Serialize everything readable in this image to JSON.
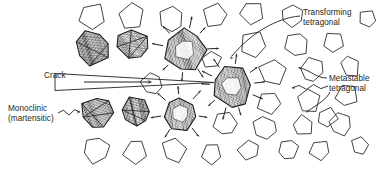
{
  "figure": {
    "domain": "materials-science-schematic",
    "width": 387,
    "height": 171,
    "background_color": "#ffffff",
    "ink_color": "#231f20",
    "text_color": "#231f20"
  },
  "labels": {
    "transforming": "Transforming\ntetragonal",
    "metastable": "Metastable\ntetragonal",
    "monoclinic": "Monoclinic\n(martensitic)",
    "crack": "Crack"
  },
  "legend_items": [
    {
      "id": "monoclinic",
      "text": "Monoclinic\n(martensitic)",
      "grain_style": "striated-twinned",
      "leader": "zigzag-arrow",
      "points_to": "monoclinic-grain-lower-left"
    },
    {
      "id": "transforming",
      "text": "Transforming\ntetragonal",
      "grain_style": "hatched-with-radiating-arrows",
      "leader": "curved-arrow",
      "points_to": "transforming-grain-center"
    },
    {
      "id": "metastable",
      "text": "Metastable\ntetragonal",
      "grain_style": "plain-outline-polygon",
      "leader": "zigzag-arrow",
      "points_to": "metastable-grain-right"
    },
    {
      "id": "crack",
      "text": "Crack",
      "grain_style": "wedge-with-propagation-arrow",
      "leader": "straight-line",
      "points_to": "crack-wedge"
    }
  ],
  "grain_counts": {
    "monoclinic_martensitic": 4,
    "transforming_tetragonal": 3,
    "metastable_tetragonal": 31
  },
  "crack": {
    "label": "Crack",
    "shape": "thin-wedge",
    "propagation_direction": "right",
    "tip_x": 214,
    "mouth_x": 55,
    "arrow_label": "propagation-direction-arrow"
  },
  "grains": {
    "monoclinic": [
      {
        "cx": 93,
        "cy": 47,
        "r": 17,
        "rot": -12
      },
      {
        "cx": 133,
        "cy": 45,
        "r": 16,
        "rot": 14
      },
      {
        "cx": 97,
        "cy": 113,
        "r": 16,
        "rot": 8
      },
      {
        "cx": 136,
        "cy": 112,
        "r": 15,
        "rot": -9
      }
    ],
    "transforming": [
      {
        "cx": 185,
        "cy": 50,
        "r": 20,
        "rot": 6,
        "arrows": 8
      },
      {
        "cx": 232,
        "cy": 86,
        "r": 20,
        "rot": -5,
        "arrows": 10
      },
      {
        "cx": 180,
        "cy": 113,
        "r": 17,
        "rot": 10,
        "arrows": 7
      }
    ],
    "metastable": [
      {
        "cx": 92,
        "cy": 16,
        "r": 13,
        "rot": 18
      },
      {
        "cx": 131,
        "cy": 16,
        "r": 13,
        "rot": -22
      },
      {
        "cx": 171,
        "cy": 19,
        "r": 12,
        "rot": 30
      },
      {
        "cx": 215,
        "cy": 16,
        "r": 12,
        "rot": -14
      },
      {
        "cx": 253,
        "cy": 13,
        "r": 12,
        "rot": 25
      },
      {
        "cx": 292,
        "cy": 15,
        "r": 11,
        "rot": -30
      },
      {
        "cx": 253,
        "cy": 44,
        "r": 13,
        "rot": 10
      },
      {
        "cx": 296,
        "cy": 45,
        "r": 12,
        "rot": -18
      },
      {
        "cx": 334,
        "cy": 42,
        "r": 11,
        "rot": 22
      },
      {
        "cx": 272,
        "cy": 72,
        "r": 13,
        "rot": -8
      },
      {
        "cx": 312,
        "cy": 70,
        "r": 12,
        "rot": 16
      },
      {
        "cx": 350,
        "cy": 66,
        "r": 11,
        "rot": -25
      },
      {
        "cx": 269,
        "cy": 102,
        "r": 12,
        "rot": 12
      },
      {
        "cx": 309,
        "cy": 100,
        "r": 12,
        "rot": -20
      },
      {
        "cx": 347,
        "cy": 96,
        "r": 11,
        "rot": 28
      },
      {
        "cx": 226,
        "cy": 124,
        "r": 12,
        "rot": -12
      },
      {
        "cx": 265,
        "cy": 128,
        "r": 12,
        "rot": 20
      },
      {
        "cx": 303,
        "cy": 126,
        "r": 11,
        "rot": -26
      },
      {
        "cx": 341,
        "cy": 124,
        "r": 11,
        "rot": 14
      },
      {
        "cx": 96,
        "cy": 150,
        "r": 13,
        "rot": -16
      },
      {
        "cx": 135,
        "cy": 151,
        "r": 12,
        "rot": 24
      },
      {
        "cx": 174,
        "cy": 150,
        "r": 12,
        "rot": -10
      },
      {
        "cx": 212,
        "cy": 153,
        "r": 11,
        "rot": 18
      },
      {
        "cx": 249,
        "cy": 150,
        "r": 11,
        "rot": -28
      },
      {
        "cx": 152,
        "cy": 84,
        "r": 11,
        "rot": 14
      },
      {
        "cx": 212,
        "cy": 60,
        "r": 9,
        "rot": -18
      },
      {
        "cx": 327,
        "cy": 118,
        "r": 10,
        "rot": 8
      },
      {
        "cx": 288,
        "cy": 150,
        "r": 10,
        "rot": -14
      },
      {
        "cx": 320,
        "cy": 150,
        "r": 10,
        "rot": 20
      },
      {
        "cx": 360,
        "cy": 146,
        "r": 9,
        "rot": -8
      },
      {
        "cx": 368,
        "cy": 19,
        "r": 9,
        "rot": 12
      }
    ]
  }
}
